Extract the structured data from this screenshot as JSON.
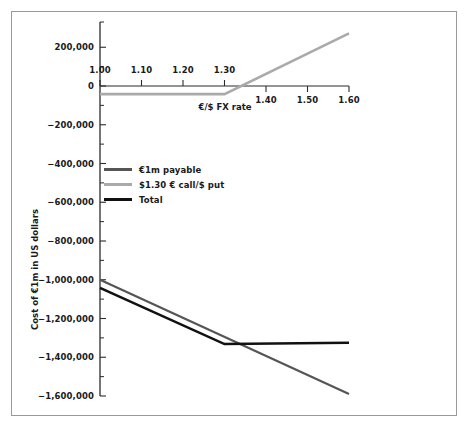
{
  "chart_data": {
    "type": "line",
    "title": "",
    "xlabel": "€/$ FX rate",
    "ylabel": "Cost of €1m in US dollars",
    "xlim": [
      1.0,
      1.6
    ],
    "ylim": [
      -1600000,
      300000
    ],
    "grid": false,
    "legend_position": "inside-left",
    "x_ticks": [
      "1.00",
      "1.10",
      "1.20",
      "1.30",
      "1.40",
      "1.50",
      "1.60"
    ],
    "x_tick_values": [
      1.0,
      1.1,
      1.2,
      1.3,
      1.4,
      1.5,
      1.6
    ],
    "y_ticks": [
      "200,000",
      "0",
      "−200,000",
      "−400,000",
      "−600,000",
      "−800,000",
      "−1,000,000",
      "−1,200,000",
      "−1,400,000",
      "−1,600,000"
    ],
    "y_tick_values": [
      200000,
      0,
      -200000,
      -400000,
      -600000,
      -800000,
      -1000000,
      -1200000,
      -1400000,
      -1600000
    ],
    "y_minor_tick_values": [
      100000,
      -100000,
      -300000,
      -500000,
      -700000,
      -900000,
      -1100000,
      -1300000,
      -1500000
    ],
    "series": [
      {
        "name": "€1m payable",
        "color": "#555555",
        "width": 2.2,
        "x": [
          1.0,
          1.6
        ],
        "values": [
          -1000000,
          -1590000
        ]
      },
      {
        "name": "$1.30 € call/$ put",
        "color": "#aaaaaa",
        "width": 2.6,
        "x": [
          1.0,
          1.3,
          1.6
        ],
        "values": [
          -42000,
          -42000,
          272000
        ]
      },
      {
        "name": "Total",
        "color": "#111111",
        "width": 2.6,
        "x": [
          1.0,
          1.3,
          1.6
        ],
        "values": [
          -1042000,
          -1332000,
          -1325000
        ]
      }
    ]
  },
  "axes": {
    "x_title": "€/$ FX rate",
    "y_title": "Cost of €1m in US dollars"
  },
  "legend": {
    "items": [
      {
        "label": "€1m payable",
        "color": "#555555"
      },
      {
        "label": "$1.30 € call/$ put",
        "color": "#aaaaaa"
      },
      {
        "label": "Total",
        "color": "#111111"
      }
    ]
  },
  "colors": {
    "frame": "#9a9a9a",
    "axis": "#2b2b2b",
    "background": "#ffffff",
    "payable": "#555555",
    "option": "#aaaaaa",
    "total": "#111111"
  }
}
